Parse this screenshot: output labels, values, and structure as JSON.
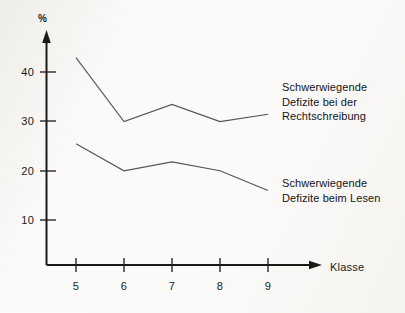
{
  "figure": {
    "background_color": "#fbfaf8",
    "ink_color": "#1a1a1a",
    "line_color": "#4a4a4a"
  },
  "axes": {
    "y_title": "%",
    "x_title": "Klasse",
    "y_ticks": [
      "10",
      "20",
      "30",
      "40"
    ],
    "x_ticks": [
      "5",
      "6",
      "7",
      "8",
      "9"
    ]
  },
  "annotations": {
    "spelling": {
      "line1": "Schwerwiegende",
      "line2": "Defizite bei der",
      "line3": "Rechtschreibung"
    },
    "reading": {
      "line1": "Schwerwiegende",
      "line2": "Defizite beim Lesen"
    }
  },
  "chart_data": {
    "type": "line",
    "title": "",
    "subtitle": "",
    "xlabel": "Klasse",
    "ylabel": "%",
    "categories": [
      "5",
      "6",
      "7",
      "8",
      "9"
    ],
    "x": [
      5,
      6,
      7,
      8,
      9
    ],
    "xlim": [
      4.6,
      9.6
    ],
    "ylim": [
      0,
      45
    ],
    "yticks": [
      10,
      20,
      30,
      40
    ],
    "xticks": [
      5,
      6,
      7,
      8,
      9
    ],
    "grid": false,
    "legend_position": "inline-right-annotations",
    "series": [
      {
        "name": "Schwerwiegende Defizite bei der Rechtschreibung",
        "values": [
          43,
          30,
          33.5,
          30,
          31.5
        ]
      },
      {
        "name": "Schwerwiegende Defizite beim Lesen",
        "values": [
          25.5,
          20,
          21.8,
          20,
          16
        ]
      }
    ]
  }
}
